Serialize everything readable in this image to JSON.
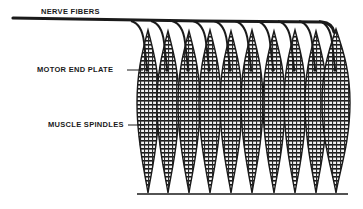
{
  "figure": {
    "labels": {
      "nerve_fibers": "NERVE FIBERS",
      "motor_end_plate": "MOTOR END PLATE",
      "muscle_spindles": "MUSCLE SPINDLES"
    },
    "spindle_count": 10,
    "spindles": [
      {
        "cx": 148,
        "top": 30,
        "bottom": 193,
        "half_width": 11
      },
      {
        "cx": 168,
        "top": 31,
        "bottom": 193,
        "half_width": 11
      },
      {
        "cx": 189,
        "top": 31,
        "bottom": 193,
        "half_width": 11
      },
      {
        "cx": 210,
        "top": 30,
        "bottom": 193,
        "half_width": 11
      },
      {
        "cx": 231,
        "top": 31,
        "bottom": 193,
        "half_width": 11
      },
      {
        "cx": 252,
        "top": 30,
        "bottom": 193,
        "half_width": 11
      },
      {
        "cx": 274,
        "top": 31,
        "bottom": 193,
        "half_width": 11
      },
      {
        "cx": 295,
        "top": 30,
        "bottom": 193,
        "half_width": 11
      },
      {
        "cx": 316,
        "top": 31,
        "bottom": 193,
        "half_width": 11
      },
      {
        "cx": 336,
        "top": 29,
        "bottom": 193,
        "half_width": 14
      }
    ],
    "colors": {
      "ink": "#1a1a1a",
      "background": "#ffffff",
      "spindle_fill": "#8a8a8a"
    }
  }
}
